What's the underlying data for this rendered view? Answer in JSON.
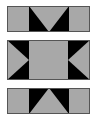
{
  "figure": {
    "canvas": {
      "width": 97,
      "height": 121,
      "background": "#ffffff"
    },
    "colors": {
      "gray": "#a8a8a8",
      "black": "#000000",
      "outline": "#555555",
      "background": "#ffffff"
    },
    "panels": [
      {
        "name": "top-panel",
        "label": "Top band with downward V notch",
        "x": 7,
        "y": 6,
        "width": 83,
        "height": 26,
        "shapes": [
          {
            "name": "gray-background",
            "kind": "rect",
            "color": "#a8a8a8"
          },
          {
            "name": "black-center-block",
            "kind": "rect",
            "color": "#000000",
            "points": "22,0 62,0 62,26 22,26"
          },
          {
            "name": "gray-v-notch",
            "kind": "triangle",
            "color": "#a8a8a8",
            "points": "22,0 62,0 42,26"
          }
        ]
      },
      {
        "name": "middle-panel",
        "label": "Tall band with inward pointing side triangles",
        "x": 7,
        "y": 40,
        "width": 83,
        "height": 40,
        "shapes": [
          {
            "name": "gray-background",
            "kind": "rect",
            "color": "#a8a8a8"
          },
          {
            "name": "black-left-block",
            "kind": "rect",
            "color": "#000000",
            "points": "0,0 22,0 22,40 0,40"
          },
          {
            "name": "gray-left-arrow",
            "kind": "triangle",
            "color": "#a8a8a8",
            "points": "0,0 22,20 0,40"
          },
          {
            "name": "black-right-block",
            "kind": "rect",
            "color": "#000000",
            "points": "61,0 83,0 83,40 61,40"
          },
          {
            "name": "gray-right-arrow",
            "kind": "triangle",
            "color": "#a8a8a8",
            "points": "83,0 61,20 83,40"
          }
        ]
      },
      {
        "name": "bottom-panel",
        "label": "Bottom band with upward pointing triangle",
        "x": 7,
        "y": 88,
        "width": 83,
        "height": 26,
        "shapes": [
          {
            "name": "gray-background",
            "kind": "rect",
            "color": "#a8a8a8"
          },
          {
            "name": "black-center-block",
            "kind": "rect",
            "color": "#000000",
            "points": "22,0 62,0 62,26 22,26"
          },
          {
            "name": "gray-up-triangle",
            "kind": "triangle",
            "color": "#a8a8a8",
            "points": "42,0 62,26 22,26"
          }
        ]
      }
    ]
  }
}
